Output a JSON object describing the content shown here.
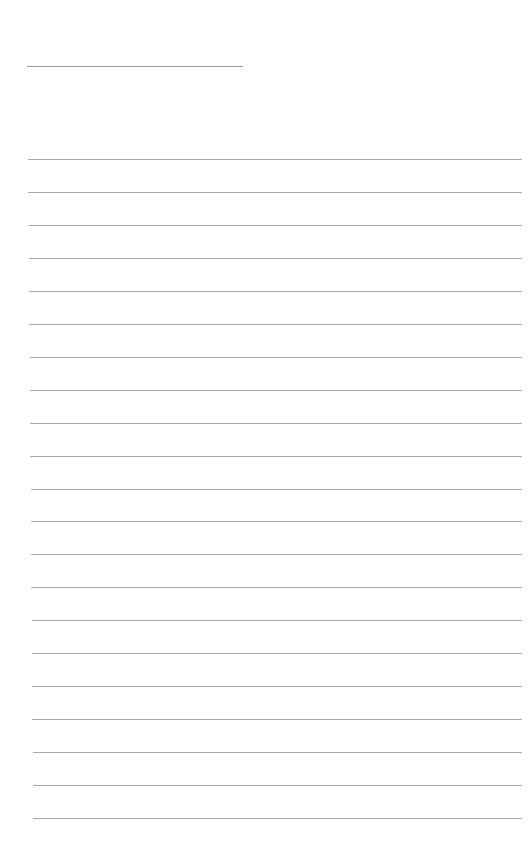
{
  "page": {
    "type": "lined-paper",
    "background": "#ffffff",
    "line_color": "#a8a8a8"
  },
  "header_line": {
    "x": 27,
    "y": 66,
    "width": 216
  },
  "ruled_lines": {
    "count": 21,
    "first_y": 159,
    "spacing": 32.95,
    "x_start": 28,
    "x_end": 522
  }
}
